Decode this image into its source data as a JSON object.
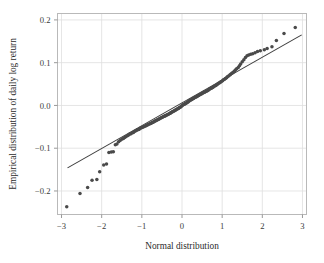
{
  "figure": {
    "title": "",
    "background_color": "#ffffff",
    "frame_color": "#b9b9b9",
    "grid_color": "#dedede",
    "point_color": "#4a4a4a",
    "line_color": "#3c3c3c"
  },
  "axes": {
    "x_title": "Normal distribution",
    "y_title": "Empirical distribution of daily log return",
    "x_ticks": [
      "−3",
      "−2",
      "−1",
      "0",
      "1",
      "2",
      "3"
    ],
    "y_ticks": [
      "0.2",
      "0.1",
      "0.0",
      "−0.1",
      "−0.2"
    ]
  },
  "chart_data": {
    "type": "scatter",
    "title": "",
    "xlabel": "Normal distribution",
    "ylabel": "Empirical distribution of daily log return",
    "xlim": [
      -3.1,
      3.1
    ],
    "ylim": [
      -0.255,
      0.215
    ],
    "xticks": [
      -3,
      -2,
      -1,
      0,
      1,
      2,
      3
    ],
    "yticks": [
      -0.2,
      -0.1,
      0.0,
      0.1,
      0.2
    ],
    "grid": true,
    "legend": null,
    "series": [
      {
        "name": "qq-points",
        "marker": "circle",
        "color": "#4a4a4a",
        "x": [
          -2.87,
          -2.54,
          -2.35,
          -2.24,
          -2.12,
          -2.05,
          -1.95,
          -1.88,
          -1.82,
          -1.76,
          -1.71,
          -1.66,
          -1.62,
          -1.58,
          -1.54,
          -1.5,
          -1.46,
          -1.43,
          -1.4,
          -1.36,
          -1.33,
          -1.3,
          -1.27,
          -1.24,
          -1.21,
          -1.19,
          -1.16,
          -1.13,
          -1.11,
          -1.08,
          -1.06,
          -1.03,
          -1.01,
          -0.98,
          -0.96,
          -0.94,
          -0.91,
          -0.89,
          -0.87,
          -0.85,
          -0.83,
          -0.8,
          -0.78,
          -0.76,
          -0.74,
          -0.72,
          -0.7,
          -0.68,
          -0.66,
          -0.64,
          -0.62,
          -0.6,
          -0.58,
          -0.56,
          -0.54,
          -0.52,
          -0.5,
          -0.48,
          -0.46,
          -0.44,
          -0.42,
          -0.41,
          -0.39,
          -0.37,
          -0.35,
          -0.33,
          -0.31,
          -0.29,
          -0.28,
          -0.26,
          -0.24,
          -0.22,
          -0.2,
          -0.18,
          -0.17,
          -0.15,
          -0.13,
          -0.11,
          -0.09,
          -0.08,
          -0.06,
          -0.04,
          -0.02,
          0.0,
          0.02,
          0.04,
          0.06,
          0.08,
          0.09,
          0.11,
          0.13,
          0.15,
          0.17,
          0.18,
          0.2,
          0.22,
          0.24,
          0.26,
          0.28,
          0.29,
          0.31,
          0.33,
          0.35,
          0.37,
          0.39,
          0.41,
          0.42,
          0.44,
          0.46,
          0.48,
          0.5,
          0.52,
          0.54,
          0.56,
          0.58,
          0.6,
          0.62,
          0.64,
          0.66,
          0.68,
          0.7,
          0.72,
          0.74,
          0.76,
          0.78,
          0.8,
          0.83,
          0.85,
          0.87,
          0.89,
          0.91,
          0.94,
          0.96,
          0.98,
          1.01,
          1.03,
          1.06,
          1.08,
          1.11,
          1.13,
          1.16,
          1.19,
          1.21,
          1.24,
          1.27,
          1.3,
          1.33,
          1.36,
          1.4,
          1.43,
          1.46,
          1.5,
          1.54,
          1.58,
          1.62,
          1.66,
          1.71,
          1.76,
          1.82,
          1.88,
          1.95,
          2.05,
          2.12,
          2.24,
          2.35,
          2.54,
          2.82
        ],
        "y": [
          -0.237,
          -0.206,
          -0.192,
          -0.175,
          -0.173,
          -0.155,
          -0.139,
          -0.137,
          -0.11,
          -0.109,
          -0.108,
          -0.092,
          -0.09,
          -0.085,
          -0.082,
          -0.079,
          -0.077,
          -0.075,
          -0.073,
          -0.071,
          -0.069,
          -0.067,
          -0.066,
          -0.064,
          -0.063,
          -0.061,
          -0.06,
          -0.058,
          -0.057,
          -0.056,
          -0.055,
          -0.053,
          -0.052,
          -0.051,
          -0.05,
          -0.049,
          -0.048,
          -0.047,
          -0.046,
          -0.045,
          -0.044,
          -0.043,
          -0.042,
          -0.041,
          -0.04,
          -0.039,
          -0.038,
          -0.037,
          -0.036,
          -0.035,
          -0.034,
          -0.033,
          -0.032,
          -0.031,
          -0.03,
          -0.029,
          -0.028,
          -0.027,
          -0.026,
          -0.025,
          -0.024,
          -0.024,
          -0.023,
          -0.022,
          -0.021,
          -0.02,
          -0.019,
          -0.018,
          -0.017,
          -0.016,
          -0.015,
          -0.014,
          -0.013,
          -0.012,
          -0.011,
          -0.01,
          -0.009,
          -0.008,
          -0.007,
          -0.006,
          -0.005,
          -0.004,
          -0.002,
          -0.001,
          0.001,
          0.002,
          0.003,
          0.004,
          0.005,
          0.006,
          0.007,
          0.008,
          0.01,
          0.011,
          0.012,
          0.013,
          0.014,
          0.015,
          0.016,
          0.017,
          0.018,
          0.019,
          0.02,
          0.021,
          0.022,
          0.023,
          0.024,
          0.025,
          0.026,
          0.027,
          0.028,
          0.029,
          0.03,
          0.031,
          0.032,
          0.033,
          0.034,
          0.035,
          0.036,
          0.038,
          0.039,
          0.04,
          0.041,
          0.042,
          0.043,
          0.045,
          0.046,
          0.047,
          0.049,
          0.05,
          0.052,
          0.053,
          0.055,
          0.056,
          0.058,
          0.06,
          0.061,
          0.063,
          0.065,
          0.067,
          0.069,
          0.071,
          0.073,
          0.075,
          0.077,
          0.08,
          0.083,
          0.086,
          0.089,
          0.093,
          0.097,
          0.102,
          0.107,
          0.112,
          0.116,
          0.118,
          0.12,
          0.121,
          0.123,
          0.126,
          0.128,
          0.13,
          0.133,
          0.137,
          0.152,
          0.168,
          0.182
        ]
      }
    ],
    "reference_line": {
      "name": "qq-reference-line",
      "color": "#3c3c3c",
      "x": [
        -2.85,
        2.98
      ],
      "y": [
        -0.146,
        0.165
      ]
    }
  }
}
